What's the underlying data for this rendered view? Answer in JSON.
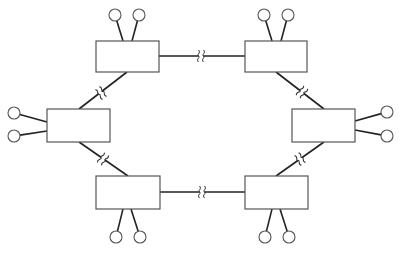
{
  "diagram": {
    "type": "ring-network-topology",
    "colors": {
      "background": "#ffffff",
      "stroke": "#222222",
      "box_stroke": "#555555"
    },
    "nodes": [
      {
        "id": "top-left",
        "x": 96,
        "y": 41,
        "w": 63,
        "h": 31,
        "terminals": [
          [
            115,
            15
          ],
          [
            139,
            15
          ]
        ],
        "stub_ends": [
          [
            123,
            41
          ],
          [
            132,
            41
          ]
        ]
      },
      {
        "id": "top-right",
        "x": 245,
        "y": 41,
        "w": 62,
        "h": 31,
        "terminals": [
          [
            264,
            15
          ],
          [
            288,
            15
          ]
        ],
        "stub_ends": [
          [
            272,
            41
          ],
          [
            281,
            41
          ]
        ]
      },
      {
        "id": "left",
        "x": 47,
        "y": 109,
        "w": 63,
        "h": 33,
        "terminals": [
          [
            14,
            113
          ],
          [
            14,
            136
          ]
        ],
        "stub_ends": [
          [
            47,
            122
          ],
          [
            47,
            131
          ]
        ]
      },
      {
        "id": "right",
        "x": 292,
        "y": 109,
        "w": 63,
        "h": 33,
        "terminals": [
          [
            387,
            112
          ],
          [
            387,
            136
          ]
        ],
        "stub_ends": [
          [
            355,
            121
          ],
          [
            355,
            130
          ]
        ]
      },
      {
        "id": "bottom-left",
        "x": 96,
        "y": 176,
        "w": 64,
        "h": 33,
        "terminals": [
          [
            116,
            237
          ],
          [
            140,
            237
          ]
        ],
        "stub_ends": [
          [
            123,
            209
          ],
          [
            131,
            209
          ]
        ]
      },
      {
        "id": "bottom-right",
        "x": 245,
        "y": 176,
        "w": 63,
        "h": 33,
        "terminals": [
          [
            265,
            237
          ],
          [
            289,
            237
          ]
        ],
        "stub_ends": [
          [
            272,
            209
          ],
          [
            280,
            209
          ]
        ]
      }
    ],
    "links": [
      {
        "from": "top-left",
        "to": "top-right",
        "x1": 159,
        "y1": 56,
        "x2": 245,
        "y2": 56,
        "break": [
          201,
          56
        ]
      },
      {
        "from": "top-left",
        "to": "left",
        "x1": 127,
        "y1": 72,
        "x2": 79,
        "y2": 109,
        "break": [
          101,
          93
        ]
      },
      {
        "from": "top-right",
        "to": "right",
        "x1": 276,
        "y1": 72,
        "x2": 324,
        "y2": 109,
        "break": [
          302,
          92
        ]
      },
      {
        "from": "left",
        "to": "bottom-left",
        "x1": 79,
        "y1": 142,
        "x2": 128,
        "y2": 176,
        "break": [
          103,
          159
        ]
      },
      {
        "from": "right",
        "to": "bottom-right",
        "x1": 324,
        "y1": 142,
        "x2": 276,
        "y2": 176,
        "break": [
          300,
          159
        ]
      },
      {
        "from": "bottom-left",
        "to": "bottom-right",
        "x1": 160,
        "y1": 192,
        "x2": 245,
        "y2": 192,
        "break": [
          202,
          192
        ]
      }
    ],
    "terminal_radius": 6
  }
}
